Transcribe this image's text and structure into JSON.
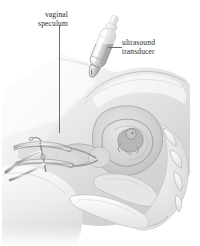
{
  "figure": {
    "kind": "medical-illustration",
    "background_color": "#ffffff",
    "line_color": "#6d6d6d",
    "text_color": "#2b2b2b"
  },
  "labels": [
    {
      "id": "vaginal-speculum",
      "line1": "vaginal",
      "line2": "speculum",
      "leader": "vertical",
      "points_to": "speculum-instrument"
    },
    {
      "id": "ultrasound-transducer",
      "line1": "ultrasound",
      "line2": "transducer",
      "leader": "horizontal",
      "points_to": "transducer-probe"
    }
  ],
  "anatomy": [
    {
      "name": "abdominal-wall",
      "tone": "#e3e3e3"
    },
    {
      "name": "uterus",
      "tone": "#cfcfcf"
    },
    {
      "name": "fetus",
      "tone": "#b4b4b4"
    },
    {
      "name": "vaginal-canal",
      "tone": "#d8d8d8"
    },
    {
      "name": "sacrum-vertebrae",
      "tone": "#efefef"
    },
    {
      "name": "pubic-bone",
      "tone": "#ededed"
    },
    {
      "name": "bladder",
      "tone": "#dedede"
    },
    {
      "name": "thigh",
      "tone": "#f0f0f0"
    }
  ],
  "instruments": [
    {
      "name": "speculum-instrument",
      "tone": "#bfbfbf",
      "detail": "bivalve metal speculum with handle and blades"
    },
    {
      "name": "transducer-probe",
      "tone": "#d2d2d2",
      "detail": "cylindrical probe with cable at proximal end, tip angled down-left"
    }
  ]
}
